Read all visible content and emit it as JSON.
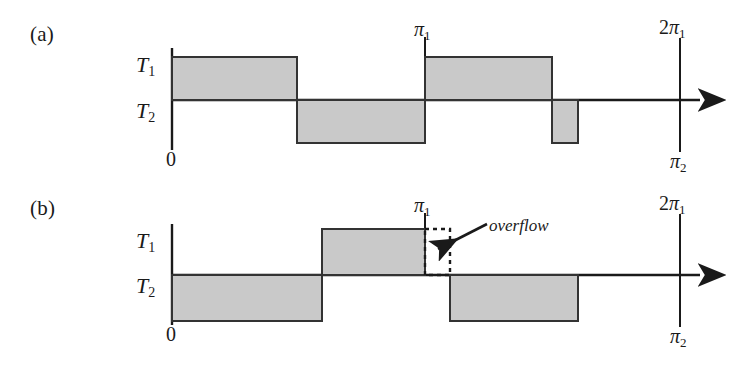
{
  "figure": {
    "background": "#ffffff",
    "ink": "#1a1a1a",
    "bar_fill": "#c9c9c9",
    "bar_stroke": "#333333",
    "panels": [
      {
        "key": "a",
        "label": "(a)",
        "label_pos": [
          30,
          22
        ],
        "axis": {
          "origin_x": 172,
          "baseline_y": 100,
          "x_end": 708,
          "y_top": 48,
          "y_bottom": 150
        },
        "y_labels": [
          {
            "name": "T1",
            "base": "T",
            "sub": "1",
            "x": 136,
            "y": 52
          },
          {
            "name": "T2",
            "base": "T",
            "sub": "2",
            "x": 136,
            "y": 98
          }
        ],
        "origin_label": {
          "text": "0",
          "x": 166,
          "y": 150
        },
        "ticks": [
          {
            "name": "pi1",
            "pi": "π",
            "sub": "1",
            "prefix": "",
            "x": 425,
            "label_y": 20,
            "line_top": 37,
            "line_bottom": 100
          },
          {
            "name": "2pi1",
            "pi": "π",
            "sub": "1",
            "prefix": "2",
            "x": 680,
            "label_y": 18,
            "line_top": 38,
            "line_bottom": 152
          },
          {
            "name": "pi2",
            "pi": "π",
            "sub": "2",
            "prefix": "",
            "x": 680,
            "label_y": 152
          }
        ],
        "bars": [
          {
            "name": "bar-a-1",
            "x0": 172,
            "x1": 297,
            "side": "above",
            "style": "solid"
          },
          {
            "name": "bar-a-2",
            "x0": 297,
            "x1": 425,
            "side": "below",
            "style": "solid"
          },
          {
            "name": "bar-a-3",
            "x0": 425,
            "x1": 552,
            "side": "above",
            "style": "solid"
          },
          {
            "name": "bar-a-4",
            "x0": 552,
            "x1": 578,
            "side": "below",
            "style": "solid"
          }
        ],
        "bar_height_above": 43,
        "bar_height_below": 43
      },
      {
        "key": "b",
        "label": "(b)",
        "label_pos": [
          30,
          196
        ],
        "axis": {
          "origin_x": 172,
          "baseline_y": 275,
          "x_end": 708,
          "y_top": 224,
          "y_bottom": 325
        },
        "y_labels": [
          {
            "name": "T1",
            "base": "T",
            "sub": "1",
            "x": 136,
            "y": 228
          },
          {
            "name": "T2",
            "base": "T",
            "sub": "2",
            "x": 136,
            "y": 273
          }
        ],
        "origin_label": {
          "text": "0",
          "x": 166,
          "y": 325
        },
        "ticks": [
          {
            "name": "pi1",
            "pi": "π",
            "sub": "1",
            "prefix": "",
            "x": 425,
            "label_y": 196,
            "line_top": 213,
            "line_bottom": 275
          },
          {
            "name": "2pi1",
            "pi": "π",
            "sub": "1",
            "prefix": "2",
            "x": 680,
            "label_y": 194,
            "line_top": 214,
            "line_bottom": 327
          },
          {
            "name": "pi2",
            "pi": "π",
            "sub": "2",
            "prefix": "",
            "x": 680,
            "label_y": 327
          }
        ],
        "bars": [
          {
            "name": "bar-b-1",
            "x0": 172,
            "x1": 322,
            "side": "below",
            "style": "solid"
          },
          {
            "name": "bar-b-2",
            "x0": 322,
            "x1": 425,
            "side": "above",
            "style": "solid"
          },
          {
            "name": "bar-b-overflow",
            "x0": 425,
            "x1": 450,
            "side": "above",
            "style": "dashed"
          },
          {
            "name": "bar-b-3",
            "x0": 450,
            "x1": 578,
            "side": "below",
            "style": "solid"
          }
        ],
        "bar_height_above": 46,
        "bar_height_below": 46,
        "annotation": {
          "name": "overflow",
          "text": "overflow",
          "text_x": 489,
          "text_y": 218,
          "arrow_from": [
            487,
            224
          ],
          "arrow_to": [
            437,
            250
          ]
        }
      }
    ]
  }
}
